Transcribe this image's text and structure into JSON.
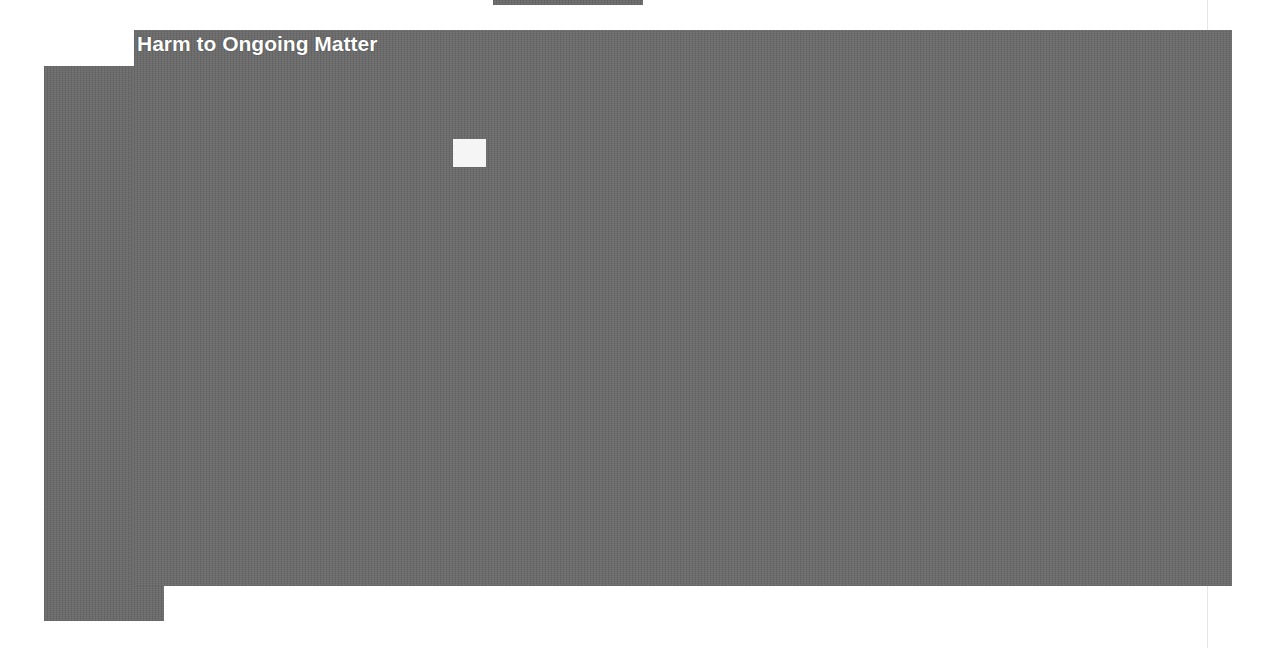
{
  "document": {
    "redaction_label": "Harm to Ongoing Matter",
    "redaction_color": "#6b6b6b",
    "label_color": "#ffffff"
  }
}
